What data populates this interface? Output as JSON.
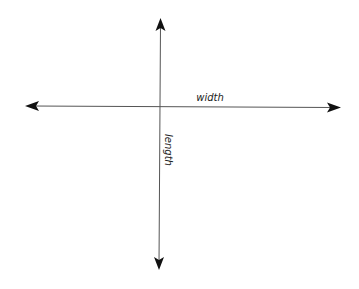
{
  "diagram": {
    "type": "axes-cross",
    "colors": {
      "line": "#555555",
      "arrow": "#111111",
      "text": "#222222",
      "background": "#ffffff"
    },
    "horizontal_axis": {
      "label": "width",
      "direction": "bidirectional"
    },
    "vertical_axis": {
      "label": "length",
      "direction": "bidirectional"
    }
  }
}
